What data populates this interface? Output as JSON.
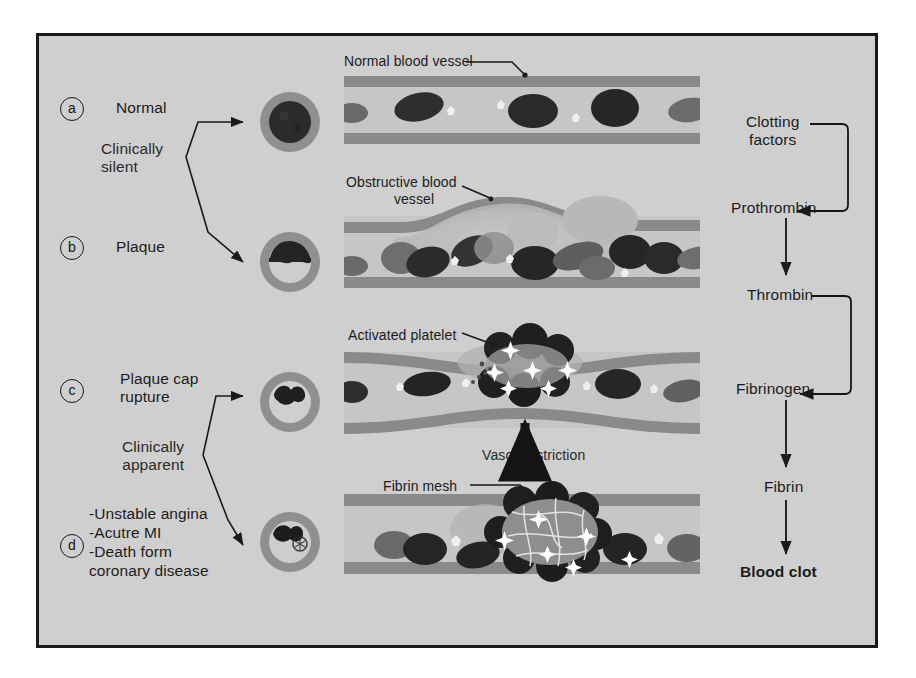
{
  "figure": {
    "background_color": "#cfcfcf",
    "frame_border_color": "#1a1a1a",
    "page_background": "#ffffff"
  },
  "stages": [
    {
      "marker": "a",
      "label": "Normal"
    },
    {
      "marker": "b",
      "label": "Plaque"
    },
    {
      "marker": "c",
      "label": "Plaque cap\nrupture"
    },
    {
      "marker": "d",
      "label": ""
    }
  ],
  "brackets": [
    {
      "id": "clinically-silent",
      "text": "Clinically\nsilent"
    },
    {
      "id": "clinically-apparent",
      "text": "Clinically\napparent"
    }
  ],
  "outcomes": {
    "items": [
      "-Unstable angina",
      "-Acutre MI",
      "-Death form",
      "coronary disease"
    ]
  },
  "vessel_callouts": [
    {
      "id": "normal-blood-vessel",
      "text": "Normal blood vessel"
    },
    {
      "id": "obstructive-blood-vessel",
      "text": "Obstructive blood\n            vessel"
    },
    {
      "id": "activated-platelet",
      "text": "Activated platelet"
    },
    {
      "id": "vasoconstriction",
      "text": "Vasoconstriction"
    },
    {
      "id": "fibrin-mesh",
      "text": "Fibrin mesh"
    }
  ],
  "cascade": {
    "nodes": [
      {
        "id": "clotting-factors",
        "text": "Clotting\nfactors",
        "bold": false
      },
      {
        "id": "prothrombin",
        "text": "Prothrombin",
        "bold": false
      },
      {
        "id": "thrombin",
        "text": "Thrombin",
        "bold": false
      },
      {
        "id": "fibrinogen",
        "text": "Fibrinogen",
        "bold": false
      },
      {
        "id": "fibrin",
        "text": "Fibrin",
        "bold": false
      },
      {
        "id": "blood-clot",
        "text": "Blood clot",
        "bold": true
      }
    ]
  },
  "colors": {
    "vessel_wall": "#8c8c8c",
    "lumen": "#c4c4c4",
    "rbc_dark": "#3a3a3a",
    "rbc_mid": "#6e6e6e",
    "plaque": "#b0b0b0",
    "platelet": "#2e2e2e",
    "ink": "#1a1a1a"
  }
}
